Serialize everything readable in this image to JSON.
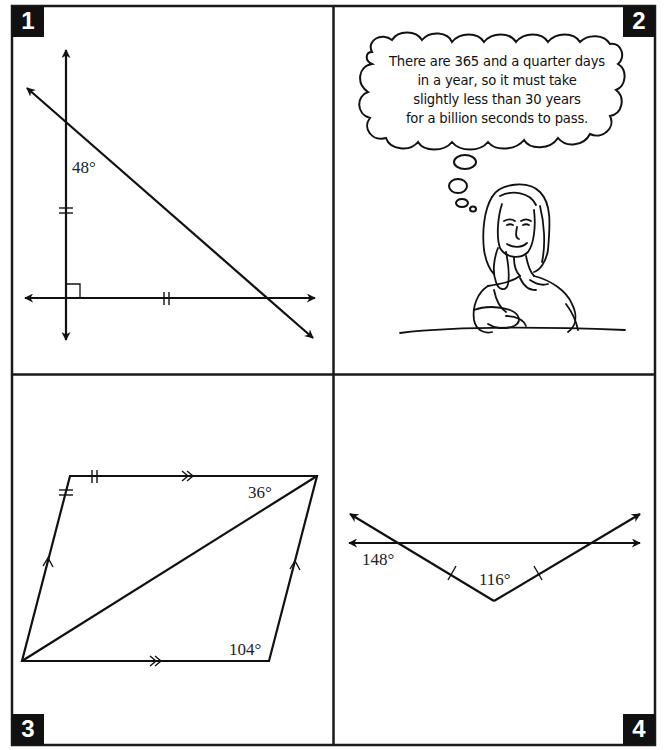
{
  "panels": [
    {
      "number": "1",
      "type": "geometry",
      "description": "Vertical line perpendicular to horizontal line, crossed by a diagonal transversal",
      "labels": {
        "angle_top": "48°"
      },
      "marks": [
        "right-angle",
        "double-tick-vertical",
        "double-tick-horizontal"
      ]
    },
    {
      "number": "2",
      "type": "cartoon",
      "thought_bubble": {
        "lines": [
          "There are 365 and a quarter days",
          "in a year, so it must take",
          "slightly less than 30 years",
          "for a billion seconds to pass."
        ]
      },
      "character": "woman thinking, chin resting on hand"
    },
    {
      "number": "3",
      "type": "geometry",
      "description": "Parallelogram with a diagonal",
      "labels": {
        "angle_top_right": "36°",
        "angle_bottom_right": "104°"
      },
      "marks": [
        "double-tick-top",
        "double-tick-left",
        "double-arrow-top",
        "double-arrow-bottom",
        "single-arrow-left",
        "single-arrow-right"
      ]
    },
    {
      "number": "4",
      "type": "geometry",
      "description": "V-shape of two rays crossing a horizontal line",
      "labels": {
        "angle_left": "148°",
        "angle_vertex": "116°"
      },
      "marks": [
        "single-tick-left",
        "single-tick-right"
      ]
    }
  ],
  "colors": {
    "ink": "#111111",
    "paper": "#ffffff"
  }
}
